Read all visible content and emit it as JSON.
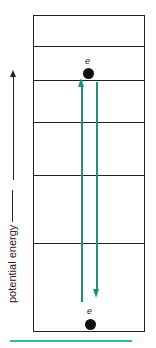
{
  "diagram": {
    "axis_label": "potential energy",
    "electron_top_label": "e",
    "electron_bottom_label": "e",
    "colors": {
      "transition_arrows": "#1f8f7e",
      "bottom_bar": "#35b5a8",
      "lines": "#222222"
    },
    "energy_levels_count": 7
  }
}
